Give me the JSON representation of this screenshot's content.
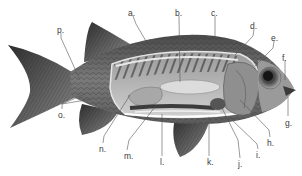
{
  "diagram": {
    "colors": {
      "background": "#ffffff",
      "body_dark": "#3c3c3c",
      "body_mid": "#6e6e6e",
      "body_light": "#b5b5b5",
      "leader_line": "#555555",
      "label_text": "#3a3a3a"
    },
    "labels": [
      {
        "id": "a",
        "text": "a.",
        "x": 128,
        "y": 9,
        "target_x": 150,
        "target_y": 48
      },
      {
        "id": "b",
        "text": "b.",
        "x": 175,
        "y": 9,
        "target_x": 180,
        "target_y": 82
      },
      {
        "id": "c",
        "text": "c.",
        "x": 211,
        "y": 9,
        "target_x": 213,
        "target_y": 40
      },
      {
        "id": "d",
        "text": "d.",
        "x": 250,
        "y": 22,
        "target_x": 235,
        "target_y": 55
      },
      {
        "id": "e",
        "text": "e.",
        "x": 271,
        "y": 34,
        "target_x": 255,
        "target_y": 66
      },
      {
        "id": "f",
        "text": "f.",
        "x": 282,
        "y": 54,
        "target_x": 285,
        "target_y": 80
      },
      {
        "id": "g",
        "text": "g.",
        "x": 285,
        "y": 119,
        "target_x": 288,
        "target_y": 97
      },
      {
        "id": "h",
        "text": "h.",
        "x": 267,
        "y": 139,
        "target_x": 240,
        "target_y": 100
      },
      {
        "id": "i",
        "text": "i.",
        "x": 256,
        "y": 151,
        "target_x": 230,
        "target_y": 118
      },
      {
        "id": "j",
        "text": "j.",
        "x": 238,
        "y": 160,
        "target_x": 222,
        "target_y": 108
      },
      {
        "id": "k",
        "text": "k.",
        "x": 207,
        "y": 158,
        "target_x": 209,
        "target_y": 117
      },
      {
        "id": "l",
        "text": "l.",
        "x": 160,
        "y": 158,
        "target_x": 162,
        "target_y": 114
      },
      {
        "id": "m",
        "text": "m.",
        "x": 124,
        "y": 152,
        "target_x": 155,
        "target_y": 107
      },
      {
        "id": "n",
        "text": "n.",
        "x": 99,
        "y": 145,
        "target_x": 130,
        "target_y": 95
      },
      {
        "id": "o",
        "text": "o.",
        "x": 58,
        "y": 111,
        "target_x": 92,
        "target_y": 99
      },
      {
        "id": "p",
        "text": "p.",
        "x": 57,
        "y": 26,
        "target_x": 80,
        "target_y": 80
      }
    ]
  }
}
